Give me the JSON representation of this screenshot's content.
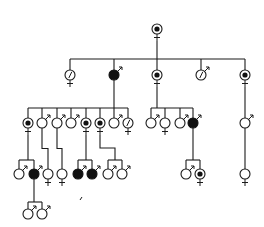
{
  "diagram": {
    "type": "pedigree",
    "title": "",
    "legend": {
      "filled": "affected",
      "dot": "carrier",
      "open": "unaffected",
      "slash": "marked"
    },
    "colors": {
      "ink": "#1a1a1a",
      "background": "#ffffff"
    },
    "generations": [
      {
        "label": "I",
        "nodes": [
          {
            "id": "I-1",
            "sex": "female",
            "status": "carrier",
            "x": 157,
            "y": 29
          }
        ]
      },
      {
        "label": "II",
        "sibline_y": 59,
        "parent": "I-1",
        "nodes": [
          {
            "id": "II-1",
            "sex": "female",
            "status": "marked",
            "x": 70,
            "y": 75
          },
          {
            "id": "II-2",
            "sex": "male",
            "status": "affected",
            "x": 114,
            "y": 75
          },
          {
            "id": "II-3",
            "sex": "female",
            "status": "carrier",
            "x": 157,
            "y": 75
          },
          {
            "id": "II-4",
            "sex": "male",
            "status": "marked",
            "x": 201,
            "y": 75
          },
          {
            "id": "II-5",
            "sex": "female",
            "status": "carrier",
            "x": 245,
            "y": 75
          }
        ]
      },
      {
        "label": "III",
        "groups": [
          {
            "parent": "II-2",
            "sibline_y": 108,
            "nodes": [
              {
                "id": "III-1",
                "sex": "female",
                "status": "carrier",
                "x": 28,
                "y": 123
              },
              {
                "id": "III-2",
                "sex": "male",
                "status": "unaffected",
                "x": 42,
                "y": 123
              },
              {
                "id": "III-3",
                "sex": "male",
                "status": "unaffected",
                "x": 57,
                "y": 123
              },
              {
                "id": "III-4",
                "sex": "male",
                "status": "unaffected",
                "x": 71,
                "y": 123
              },
              {
                "id": "III-5",
                "sex": "female",
                "status": "carrier",
                "x": 86,
                "y": 123
              },
              {
                "id": "III-6",
                "sex": "female",
                "status": "carrier",
                "x": 100,
                "y": 123
              },
              {
                "id": "III-7",
                "sex": "male",
                "status": "unaffected",
                "x": 114,
                "y": 123
              },
              {
                "id": "III-8",
                "sex": "female",
                "status": "marked",
                "x": 128,
                "y": 123
              }
            ]
          },
          {
            "parent": "II-3",
            "sibline_y": 108,
            "nodes": [
              {
                "id": "III-9",
                "sex": "male",
                "status": "unaffected",
                "x": 151,
                "y": 123
              },
              {
                "id": "III-10",
                "sex": "female",
                "status": "unaffected",
                "x": 165,
                "y": 123
              },
              {
                "id": "III-11",
                "sex": "male",
                "status": "unaffected",
                "x": 180,
                "y": 123
              },
              {
                "id": "III-12",
                "sex": "male",
                "status": "affected",
                "x": 193,
                "y": 123
              }
            ]
          },
          {
            "parent": "II-5",
            "nodes": [
              {
                "id": "III-13",
                "sex": "male",
                "status": "unaffected",
                "x": 245,
                "y": 123
              }
            ]
          }
        ]
      },
      {
        "label": "IV",
        "groups": [
          {
            "parent": "III-1",
            "sibline_y": 160,
            "nodes": [
              {
                "id": "IV-1",
                "sex": "male",
                "status": "unaffected",
                "x": 19,
                "y": 174
              },
              {
                "id": "IV-2",
                "sex": "male",
                "status": "affected",
                "x": 34,
                "y": 174
              }
            ]
          },
          {
            "parent": "III-2",
            "nodes": [
              {
                "id": "IV-3",
                "sex": "female",
                "status": "unaffected",
                "x": 48,
                "y": 174
              }
            ]
          },
          {
            "parent": "III-3",
            "nodes": [
              {
                "id": "IV-4",
                "sex": "female",
                "status": "unaffected",
                "x": 62,
                "y": 174
              }
            ]
          },
          {
            "parent": "III-5",
            "sibline_y": 160,
            "nodes": [
              {
                "id": "IV-5",
                "sex": "male",
                "status": "affected",
                "x": 78,
                "y": 174
              },
              {
                "id": "IV-6",
                "sex": "male",
                "status": "affected",
                "x": 92,
                "y": 174
              }
            ]
          },
          {
            "parent": "III-6",
            "sibline_y": 160,
            "nodes": [
              {
                "id": "IV-7",
                "sex": "male",
                "status": "unaffected",
                "x": 108,
                "y": 174
              },
              {
                "id": "IV-8",
                "sex": "male",
                "status": "unaffected",
                "x": 122,
                "y": 174
              }
            ]
          },
          {
            "parent": "III-12",
            "sibline_y": 160,
            "nodes": [
              {
                "id": "IV-9",
                "sex": "male",
                "status": "unaffected",
                "x": 186,
                "y": 174
              },
              {
                "id": "IV-10",
                "sex": "female",
                "status": "carrier",
                "x": 200,
                "y": 174
              }
            ]
          },
          {
            "parent": "III-13",
            "nodes": [
              {
                "id": "IV-11",
                "sex": "female",
                "status": "unaffected",
                "x": 245,
                "y": 174
              }
            ]
          }
        ]
      },
      {
        "label": "V",
        "groups": [
          {
            "parent": "IV-2",
            "sibline_y": 202,
            "nodes": [
              {
                "id": "V-1",
                "sex": "male",
                "status": "unaffected",
                "x": 28,
                "y": 214
              },
              {
                "id": "V-2",
                "sex": "male",
                "status": "unaffected",
                "x": 42,
                "y": 214
              }
            ]
          }
        ]
      }
    ],
    "stray_mark": {
      "x": 80,
      "y": 200
    }
  }
}
